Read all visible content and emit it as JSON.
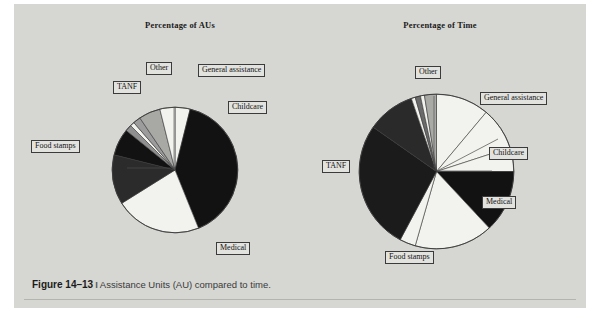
{
  "figure": {
    "number": "Figure 14–13",
    "separator": "I",
    "caption": "Assistance Units (AU) compared to time."
  },
  "colors": {
    "panel_background": "#d6d6d2",
    "label_background": "#e2e2de",
    "label_border": "#3b3b3b",
    "slice_black": "#121212",
    "slice_white": "#f2f2ee",
    "slice_dark_gray": "#6f6f6f",
    "slice_mid_gray": "#9a9a9a",
    "slice_light_gray": "#bdbdba",
    "outline": "#3a3a3a"
  },
  "chart_data": [
    {
      "type": "pie",
      "title": "Percentage of AUs",
      "legend_position": "callout-labels",
      "categories": [
        "Childcare",
        "Medical",
        "Food stamps",
        "TANF",
        "Other",
        "General assistance"
      ],
      "values": [
        4,
        40,
        22,
        13,
        14,
        7
      ],
      "slices": [
        {
          "label": "Childcare",
          "value": 4,
          "start_deg": 0,
          "end_deg": 14,
          "fill": "#f2f2ee"
        },
        {
          "label": "Medical",
          "value": 40,
          "start_deg": 14,
          "end_deg": 158,
          "fill": "#121212"
        },
        {
          "label": "Food stamps",
          "value": 22,
          "start_deg": 158,
          "end_deg": 238,
          "fill": "#f2f2ee"
        },
        {
          "label": "TANF",
          "value": 13,
          "start_deg": 238,
          "end_deg": 284,
          "fill": "#2b2b2b"
        },
        {
          "label": "Other-a",
          "value": 7,
          "start_deg": 284,
          "end_deg": 309,
          "fill": "#121212"
        },
        {
          "label": "Other-b",
          "value": 2,
          "start_deg": 309,
          "end_deg": 315,
          "fill": "#8f8f8f"
        },
        {
          "label": "Other-c",
          "value": 1,
          "start_deg": 315,
          "end_deg": 319,
          "fill": "#f2f2ee"
        },
        {
          "label": "Other-d",
          "value": 2,
          "start_deg": 319,
          "end_deg": 326,
          "fill": "#9c9c9c"
        },
        {
          "label": "General assistance",
          "value": 7,
          "start_deg": 326,
          "end_deg": 346,
          "fill": "#a8a8a5"
        },
        {
          "label": "Childcare-edge",
          "value": 4,
          "start_deg": 346,
          "end_deg": 360,
          "fill": "#f2f2ee"
        }
      ],
      "labels": [
        {
          "text": "Other"
        },
        {
          "text": "General assistance"
        },
        {
          "text": "TANF"
        },
        {
          "text": "Childcare"
        },
        {
          "text": "Food stamps"
        },
        {
          "text": "Medical"
        }
      ]
    },
    {
      "type": "pie",
      "title": "Percentage of Time",
      "legend_position": "callout-labels",
      "categories": [
        "General assistance",
        "Childcare",
        "Medical",
        "Food stamps",
        "TANF",
        "Other"
      ],
      "values": [
        11,
        9,
        13,
        19,
        45,
        3
      ],
      "slices": [
        {
          "label": "General assistance",
          "value": 11,
          "start_deg": 0,
          "end_deg": 40,
          "fill": "#f2f2ee"
        },
        {
          "label": "Childcare",
          "value": 9,
          "start_deg": 40,
          "end_deg": 72,
          "fill": "#f2f2ee"
        },
        {
          "label": "Childcare-2",
          "value": 5,
          "start_deg": 72,
          "end_deg": 90,
          "fill": "#f2f2ee"
        },
        {
          "label": "Medical",
          "value": 13,
          "start_deg": 90,
          "end_deg": 137,
          "fill": "#121212"
        },
        {
          "label": "Food stamps",
          "value": 19,
          "start_deg": 137,
          "end_deg": 196,
          "fill": "#f2f2ee"
        },
        {
          "label": "Food stamps-2",
          "value": 4,
          "start_deg": 196,
          "end_deg": 208,
          "fill": "#f2f2ee"
        },
        {
          "label": "TANF",
          "value": 45,
          "start_deg": 208,
          "end_deg": 305,
          "fill": "#1b1b1b"
        },
        {
          "label": "TANF-2",
          "value": 15,
          "start_deg": 305,
          "end_deg": 341,
          "fill": "#2a2a2a"
        },
        {
          "label": "Other-a",
          "value": 1,
          "start_deg": 341,
          "end_deg": 344,
          "fill": "#f2f2ee"
        },
        {
          "label": "Other-b",
          "value": 1,
          "start_deg": 344,
          "end_deg": 348,
          "fill": "#6a6a6a"
        },
        {
          "label": "Other-c",
          "value": 1,
          "start_deg": 348,
          "end_deg": 351,
          "fill": "#f2f2ee"
        },
        {
          "label": "Other-d",
          "value": 2,
          "start_deg": 351,
          "end_deg": 360,
          "fill": "#a9a9a6"
        }
      ],
      "labels": [
        {
          "text": "Other"
        },
        {
          "text": "General assistance"
        },
        {
          "text": "Childcare"
        },
        {
          "text": "Medical"
        },
        {
          "text": "Food stamps"
        },
        {
          "text": "TANF"
        }
      ]
    }
  ]
}
